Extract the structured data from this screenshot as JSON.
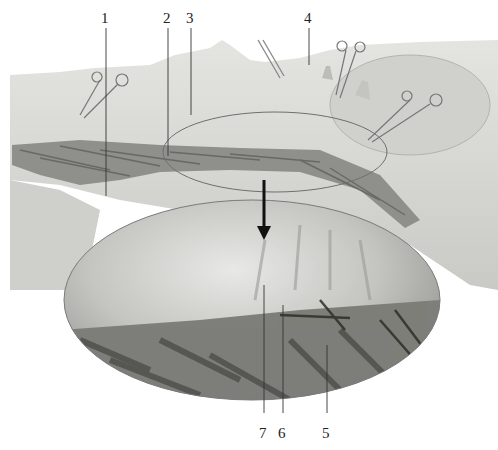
{
  "figure": {
    "type": "anatomical dissection photograph with magnified inset",
    "labels": [
      {
        "id": "1",
        "text": "1"
      },
      {
        "id": "2",
        "text": "2"
      },
      {
        "id": "3",
        "text": "3"
      },
      {
        "id": "4",
        "text": "4"
      },
      {
        "id": "5",
        "text": "5"
      },
      {
        "id": "6",
        "text": "6"
      },
      {
        "id": "7",
        "text": "7"
      }
    ],
    "colors": {
      "background": "#ffffff",
      "skin": "#d9d9d6",
      "skin_dark": "#b9b9b5",
      "muscle": "#8a8a86",
      "muscle_dark": "#5e5e5a",
      "leader": "#333333",
      "inset_border": "#7a7a7a",
      "arrow": "#111111"
    }
  }
}
